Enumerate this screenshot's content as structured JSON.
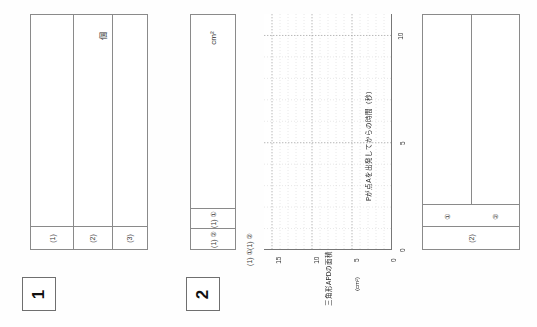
{
  "sheet": {
    "orientation": "rotated-90-ccw",
    "language": "ja",
    "paper_color": "#fefefe",
    "rule_color": "#8a8a8a"
  },
  "question1": {
    "number_label": "1",
    "unit_label": "個",
    "answer_labels": [
      "(1)",
      "(2)",
      "(3)"
    ],
    "column_widths_pct": [
      36,
      34,
      30
    ]
  },
  "question2": {
    "number_label": "2",
    "unit_label": "cm²",
    "answer_labels": [
      "(1) ①",
      "(1) ②"
    ],
    "side_labels": [
      "(1) ②",
      "(1) ①"
    ]
  },
  "graph": {
    "x_axis_label": "Pが点Aを出発してからの時間（秒）",
    "y_axis_label": "三角形APDの面積",
    "y_axis_unit": "(cm²)",
    "x_ticks": [
      "0",
      "5",
      "10"
    ],
    "y_ticks": [
      "0",
      "5",
      "10",
      "15"
    ],
    "grid": "dotted"
  },
  "question3": {
    "answer_labels_top": [
      "①",
      "②"
    ],
    "answer_label_bottom": "(2)"
  },
  "chart_data": {
    "type": "line",
    "title": "",
    "xlabel": "Pが点Aを出発してからの時間（秒）",
    "ylabel": "三角形APDの面積 (cm²)",
    "x": [],
    "values": [],
    "xlim": [
      0,
      11
    ],
    "ylim": [
      0,
      16
    ],
    "x_tick_values": [
      0,
      5,
      10
    ],
    "y_tick_values": [
      0,
      5,
      10,
      15
    ],
    "grid": true,
    "legend": "none",
    "note": "blank answer grid — no data plotted"
  }
}
